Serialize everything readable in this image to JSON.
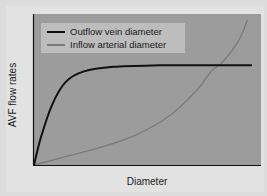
{
  "chart_data": {
    "type": "line",
    "title": "",
    "xlabel": "Diameter",
    "ylabel": "AVF flow rates",
    "x_ticks": [],
    "y_ticks": [],
    "grid": false,
    "legend_position": "upper-left",
    "xlim": [
      0,
      100
    ],
    "ylim": [
      0,
      100
    ],
    "series": [
      {
        "name": "Outflow vein diameter",
        "color": "#111111",
        "points": [
          [
            0,
            0
          ],
          [
            3,
            18
          ],
          [
            8,
            40
          ],
          [
            14,
            55
          ],
          [
            22,
            62
          ],
          [
            35,
            65
          ],
          [
            55,
            66
          ],
          [
            75,
            66
          ],
          [
            96,
            66
          ]
        ]
      },
      {
        "name": "Inflow arterial diameter",
        "color": "#7a7a7a",
        "points": [
          [
            0,
            0
          ],
          [
            15,
            6
          ],
          [
            30,
            12
          ],
          [
            45,
            20
          ],
          [
            60,
            33
          ],
          [
            72,
            50
          ],
          [
            78,
            62
          ],
          [
            83,
            68
          ],
          [
            90,
            82
          ],
          [
            94,
            96
          ]
        ]
      }
    ],
    "annotations": []
  },
  "legend": {
    "items": [
      {
        "label": "Outflow vein diameter",
        "color": "#111111"
      },
      {
        "label": "Inflow arterial diameter",
        "color": "#7a7a7a"
      }
    ]
  },
  "colors": {
    "plot_background": "#9c9c9c",
    "legend_background": "#bdbdbd",
    "axis": "#111111",
    "page_background": "#dcdcdc"
  }
}
